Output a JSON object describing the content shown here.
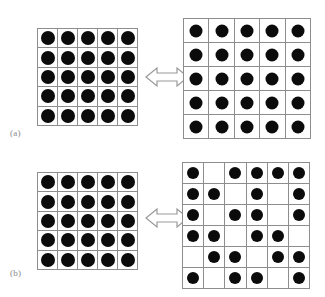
{
  "figure": {
    "caption_style": "two-panel lattice occupancy comparison",
    "panels": [
      {
        "id": "a",
        "label": "(a)",
        "relation_icon": "double-headed-horizontal-arrow",
        "left": {
          "name": "dense-lattice-a",
          "rows": 5,
          "cols": 5,
          "occupancy": [
            [
              1,
              1,
              1,
              1,
              1
            ],
            [
              1,
              1,
              1,
              1,
              1
            ],
            [
              1,
              1,
              1,
              1,
              1
            ],
            [
              1,
              1,
              1,
              1,
              1
            ],
            [
              1,
              1,
              1,
              1,
              1
            ]
          ]
        },
        "right": {
          "name": "expanded-lattice-a",
          "rows": 5,
          "cols": 5,
          "occupancy": [
            [
              1,
              1,
              1,
              1,
              1
            ],
            [
              1,
              1,
              1,
              1,
              1
            ],
            [
              1,
              1,
              1,
              1,
              1
            ],
            [
              1,
              1,
              1,
              1,
              1
            ],
            [
              1,
              1,
              1,
              1,
              1
            ]
          ]
        }
      },
      {
        "id": "b",
        "label": "(b)",
        "relation_icon": "double-headed-horizontal-arrow",
        "left": {
          "name": "dense-lattice-b",
          "rows": 5,
          "cols": 5,
          "occupancy": [
            [
              1,
              1,
              1,
              1,
              1
            ],
            [
              1,
              1,
              1,
              1,
              1
            ],
            [
              1,
              1,
              1,
              1,
              1
            ],
            [
              1,
              1,
              1,
              1,
              1
            ],
            [
              1,
              1,
              1,
              1,
              1
            ]
          ]
        },
        "right": {
          "name": "disordered-lattice-b",
          "rows": 6,
          "cols": 6,
          "occupancy": [
            [
              1,
              0,
              1,
              1,
              1,
              1
            ],
            [
              1,
              1,
              0,
              1,
              0,
              1
            ],
            [
              1,
              0,
              1,
              1,
              0,
              1
            ],
            [
              1,
              1,
              0,
              1,
              1,
              0
            ],
            [
              0,
              1,
              1,
              0,
              1,
              1
            ],
            [
              1,
              0,
              1,
              1,
              0,
              1
            ]
          ]
        }
      }
    ]
  },
  "colors": {
    "particle": "#0b0b0b",
    "gridline": "#8d8d8d",
    "background": "#ffffff",
    "label_text": "#8a8a8a",
    "arrow_stroke": "#9a9a9a",
    "arrow_fill": "#ffffff"
  }
}
